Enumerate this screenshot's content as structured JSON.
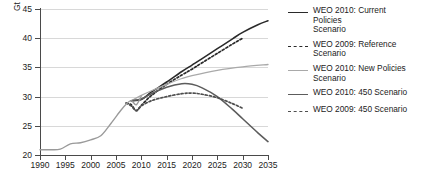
{
  "chart_data": {
    "type": "line",
    "title": "",
    "xlabel": "",
    "ylabel": "Gt",
    "xlim": [
      1990,
      2035
    ],
    "ylim": [
      20,
      45
    ],
    "grid": true,
    "legend_position": "right",
    "y_ticks": [
      20,
      25,
      30,
      35,
      40,
      45
    ],
    "x_ticks": [
      1990,
      1995,
      2000,
      2005,
      2010,
      2015,
      2020,
      2025,
      2030,
      2035
    ],
    "series": [
      {
        "name": "WEO 2010: Current Policies Scenario",
        "style": "solid",
        "color": "#2a2a2a",
        "x": [
          2008,
          2010,
          2012,
          2015,
          2018,
          2020,
          2022,
          2025,
          2028,
          2030,
          2033,
          2035
        ],
        "values": [
          29.3,
          29.5,
          30.8,
          32.5,
          34.3,
          35.4,
          36.5,
          38.2,
          39.9,
          41.0,
          42.3,
          43.0
        ]
      },
      {
        "name": "WEO 2009: Reference Scenario",
        "style": "dashed",
        "color": "#2a2a2a",
        "x": [
          2007,
          2008,
          2009,
          2010,
          2012,
          2015,
          2018,
          2020,
          2022,
          2025,
          2028,
          2030
        ],
        "values": [
          28.9,
          28.6,
          27.6,
          28.5,
          30.2,
          32.1,
          33.7,
          34.7,
          35.8,
          37.4,
          39.0,
          40.0
        ]
      },
      {
        "name": "WEO 2010: New Policies Scenario",
        "style": "solid",
        "color": "#a9a9a9",
        "x": [
          2008,
          2010,
          2012,
          2015,
          2018,
          2020,
          2025,
          2030,
          2035
        ],
        "values": [
          29.3,
          30.2,
          31.0,
          32.1,
          33.1,
          33.6,
          34.5,
          35.1,
          35.5
        ]
      },
      {
        "name": "WEO 2010: 450 Scenario",
        "style": "solid",
        "color": "#5c5c5c",
        "x": [
          2008,
          2010,
          2012,
          2015,
          2018,
          2020,
          2022,
          2025,
          2028,
          2030,
          2033,
          2035
        ],
        "values": [
          29.3,
          29.6,
          30.5,
          31.6,
          32.2,
          32.1,
          31.5,
          30.0,
          27.8,
          26.2,
          23.8,
          22.3
        ]
      },
      {
        "name": "WEO 2009: 450 Scenario",
        "style": "dashed",
        "color": "#4f4f4f",
        "x": [
          2007,
          2008,
          2009,
          2010,
          2012,
          2015,
          2018,
          2020,
          2022,
          2025,
          2028,
          2030
        ],
        "values": [
          28.9,
          28.4,
          27.6,
          28.4,
          29.3,
          30.0,
          30.5,
          30.6,
          30.4,
          29.8,
          28.8,
          28.0
        ]
      },
      {
        "name": "Historical",
        "style": "solid",
        "color": "#9a9a9a",
        "x": [
          1990,
          1992,
          1994,
          1996,
          1998,
          2000,
          2002,
          2004,
          2006,
          2007,
          2008,
          2009,
          2010
        ],
        "values": [
          20.9,
          20.9,
          21.0,
          21.9,
          22.1,
          22.6,
          23.3,
          25.4,
          27.7,
          28.7,
          29.3,
          28.6,
          30.1
        ]
      }
    ]
  },
  "axis": {
    "y_unit": "Gt",
    "y_labels": [
      "45",
      "40",
      "35",
      "30",
      "25",
      "20"
    ],
    "x_labels": [
      "1990",
      "1995",
      "2000",
      "2005",
      "2010",
      "2015",
      "2020",
      "2025",
      "2030",
      "2035"
    ]
  },
  "legend": {
    "entries": [
      {
        "label": "WEO 2010: Current\nPolicies\nScenario",
        "style": "solid-dark"
      },
      {
        "label": "WEO 2009: Reference\nScenario",
        "style": "dashed-dark"
      },
      {
        "label": "WEO 2010: New Policies\nScenario",
        "style": "solid-light"
      },
      {
        "label": "WEO 2010: 450 Scenario",
        "style": "solid-mid"
      },
      {
        "label": "WEO 2009: 450 Scenario",
        "style": "dashed-mid"
      }
    ]
  },
  "caption": {
    "text": ""
  }
}
